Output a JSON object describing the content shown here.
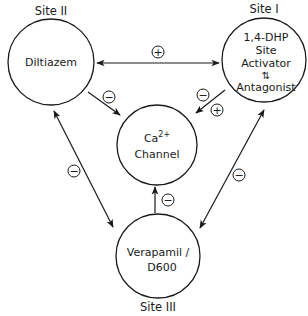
{
  "colors": {
    "ink": "#1a1a1a",
    "background": "#ffffff"
  },
  "nodes": {
    "site2": {
      "site_label": "Site II",
      "lines": [
        "Diltiazem"
      ]
    },
    "site1": {
      "site_label": "Site I",
      "lines": [
        "1,4-DHP",
        "Site",
        "Activator",
        "⇅",
        "Antagonist"
      ]
    },
    "channel": {
      "lines": [
        "Ca",
        "2+",
        "Channel"
      ]
    },
    "site3": {
      "site_label": "Site III",
      "lines": [
        "Verapamil /",
        "D600"
      ]
    }
  },
  "edges": [
    {
      "from": "site2",
      "to": "site1",
      "direction": "bidirectional",
      "sign": "+"
    },
    {
      "from": "site2",
      "to": "channel",
      "direction": "forward",
      "sign": "−"
    },
    {
      "from": "site1",
      "to": "channel",
      "direction": "forward",
      "sign": "−",
      "sign2": "+"
    },
    {
      "from": "site2",
      "to": "site3",
      "direction": "bidirectional",
      "sign": "−"
    },
    {
      "from": "site1",
      "to": "site3",
      "direction": "bidirectional",
      "sign": "−"
    },
    {
      "from": "site3",
      "to": "channel",
      "direction": "forward",
      "sign": "−"
    }
  ]
}
